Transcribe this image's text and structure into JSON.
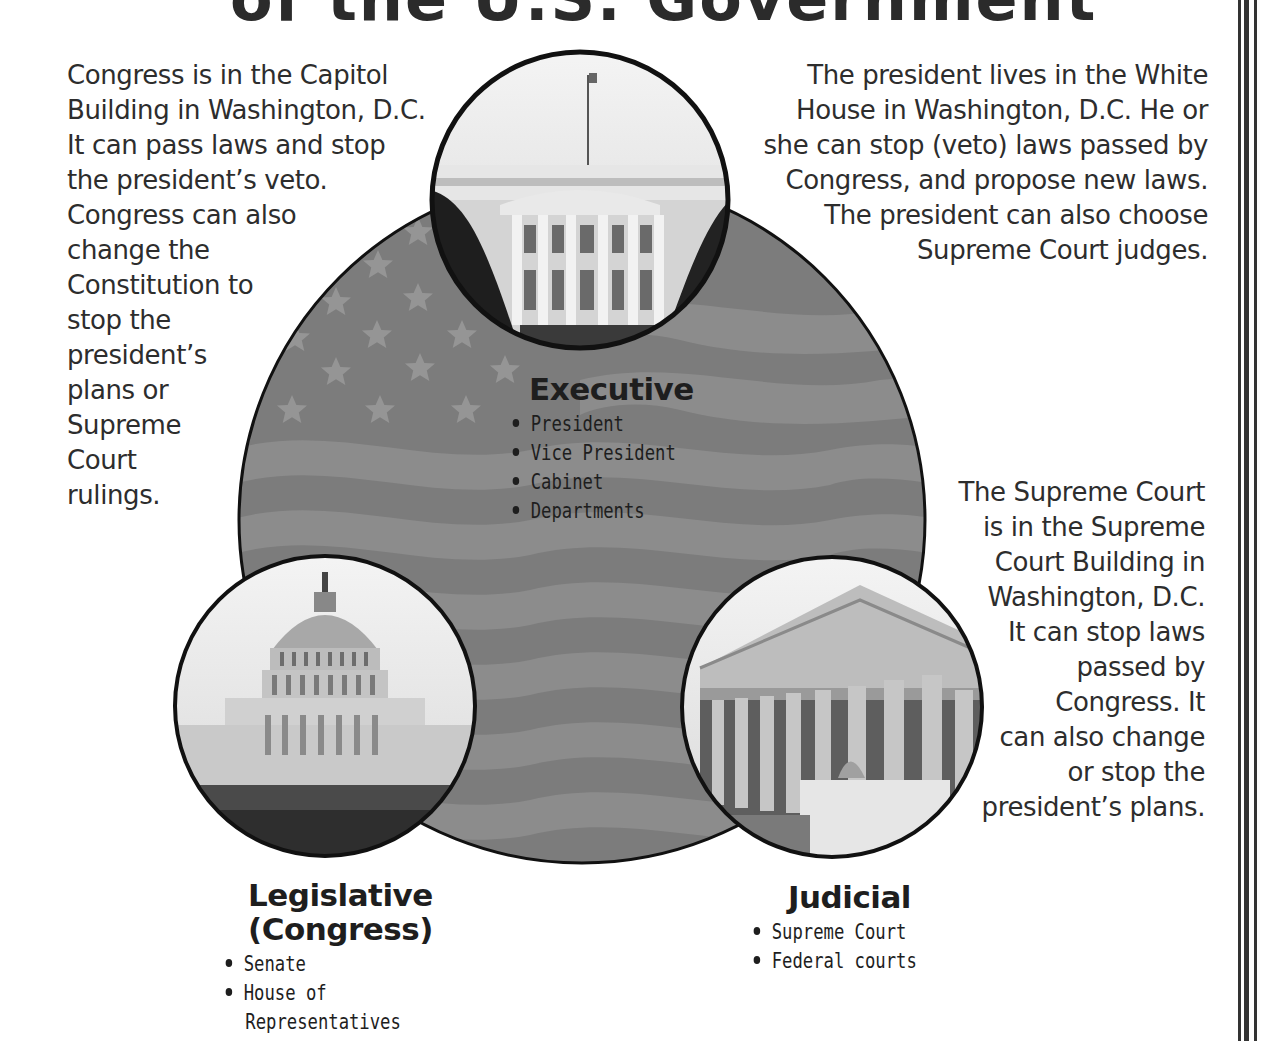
{
  "title_fragment": "of the U.S. Government",
  "colors": {
    "flag_light": "#8a8a8a",
    "flag_dark": "#777777",
    "star": "#9c9c9c",
    "outline": "#111111",
    "text": "#2d2d2d"
  },
  "paragraphs": {
    "congress": "Congress is in the Capitol\nBuilding in Washington, D.C.\nIt can pass laws and stop\nthe president’s veto.\nCongress can also\nchange the\nConstitution to\nstop the\npresident’s\nplans or\nSupreme\nCourt\nrulings.",
    "president": "The president lives in the White\nHouse in Washington, D.C.  He or\nshe can stop (veto) laws passed by\nCongress, and propose new laws.\nThe president can also choose\nSupreme Court judges.",
    "supreme_court": "The Supreme Court\nis in the Supreme\nCourt Building in\nWashington, D.C.\nIt can stop laws\npassed by\nCongress.  It\ncan also change\nor stop the\npresident’s plans."
  },
  "branches": {
    "executive": {
      "title": "Executive",
      "image": "white-house-photo",
      "items": [
        "President",
        "Vice President",
        "Cabinet",
        "Departments"
      ]
    },
    "legislative": {
      "title_line1": "Legislative",
      "title_line2": "(Congress)",
      "image": "capitol-building-photo",
      "items": [
        "Senate",
        "House of",
        "Representatives"
      ]
    },
    "judicial": {
      "title": "Judicial",
      "image": "supreme-court-photo",
      "items": [
        "Supreme Court",
        "Federal courts"
      ]
    }
  }
}
